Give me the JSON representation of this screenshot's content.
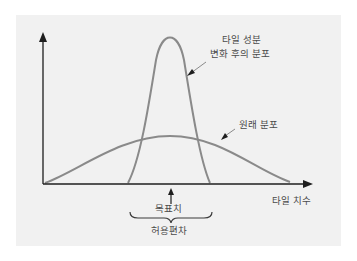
{
  "diagram": {
    "labels": {
      "after_change_line1": "타일 성분",
      "after_change_line2": "변화 후의 분포",
      "original": "원래 분포",
      "x_axis": "타일 치수",
      "target": "목표치",
      "tolerance": "허용편차"
    },
    "colors": {
      "background": "#f1f1f1",
      "curve": "#8a8a8a",
      "axis": "#1e1e1e",
      "text": "#4a4a4a"
    },
    "curves": [
      {
        "name": "변화 후의 분포",
        "shape": "narrow-tall",
        "peak_x": 170,
        "peak_y": 37
      },
      {
        "name": "원래 분포",
        "shape": "wide-flat",
        "peak_x": 170,
        "peak_y": 136
      }
    ]
  }
}
